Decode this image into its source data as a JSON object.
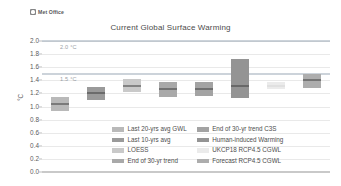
{
  "brand": {
    "name": "Met Office",
    "mark_icon": "met-office-logo-icon"
  },
  "chart_data": {
    "type": "bar",
    "title": "Current Global Surface Warming",
    "xlabel": "",
    "ylabel": "°C",
    "ylim": [
      0.0,
      2.0
    ],
    "grid": true,
    "legend_position": "bottom-center",
    "yticks": [
      "0.0",
      "0.2",
      "0.4",
      "0.6",
      "0.8",
      "1.0",
      "1.2",
      "1.4",
      "1.6",
      "1.8",
      "2.0"
    ],
    "ytick_values": [
      0.0,
      0.2,
      0.4,
      0.6,
      0.8,
      1.0,
      1.2,
      1.4,
      1.6,
      1.8,
      2.0
    ],
    "reference_lines": [
      {
        "label": "2.0 °C",
        "value": 2.0,
        "color": "#9aa7b5"
      },
      {
        "label": "1.5 °C",
        "value": 1.5,
        "color": "#9aa7b5"
      }
    ],
    "categories": [
      "Last 20-yrs avg GWL",
      "Last 10-yrs avg",
      "LOESS",
      "End of 30-yr trend",
      "End of 30-yr trend C3S",
      "Human-induced Warming",
      "UKCP18 RCP4.5 CGWL",
      "Forecast RCP4.5 CGWL"
    ],
    "values": [
      1.04,
      1.2,
      1.31,
      1.26,
      1.26,
      1.32,
      1.31,
      1.4
    ],
    "ranges": [
      {
        "low": 0.93,
        "high": 1.15
      },
      {
        "low": 1.1,
        "high": 1.3
      },
      {
        "low": 1.22,
        "high": 1.42
      },
      {
        "low": 1.15,
        "high": 1.38
      },
      {
        "low": 1.16,
        "high": 1.37
      },
      {
        "low": 1.13,
        "high": 1.73
      },
      {
        "low": 1.26,
        "high": 1.37
      },
      {
        "low": 1.28,
        "high": 1.5
      }
    ],
    "colors": [
      "#b9b9b9",
      "#9a9a9a",
      "#c9c9c9",
      "#a9a9a9",
      "#a3a3a3",
      "#949494",
      "#ebebeb",
      "#adadad"
    ],
    "legend": [
      {
        "label": "Last 20-yrs avg GWL",
        "color": "#b9b9b9"
      },
      {
        "label": "Last 10-yrs avg",
        "color": "#9a9a9a"
      },
      {
        "label": "LOESS",
        "color": "#c9c9c9"
      },
      {
        "label": "End of 30-yr trend",
        "color": "#a9a9a9"
      },
      {
        "label": "End of 30-yr trend C3S",
        "color": "#a3a3a3"
      },
      {
        "label": "Human-induced Warming",
        "color": "#949494"
      },
      {
        "label": "UKCP18 RCP4.5 CGWL",
        "color": "#ebebeb"
      },
      {
        "label": "Forecast RCP4.5 CGWL",
        "color": "#adadad"
      }
    ]
  }
}
